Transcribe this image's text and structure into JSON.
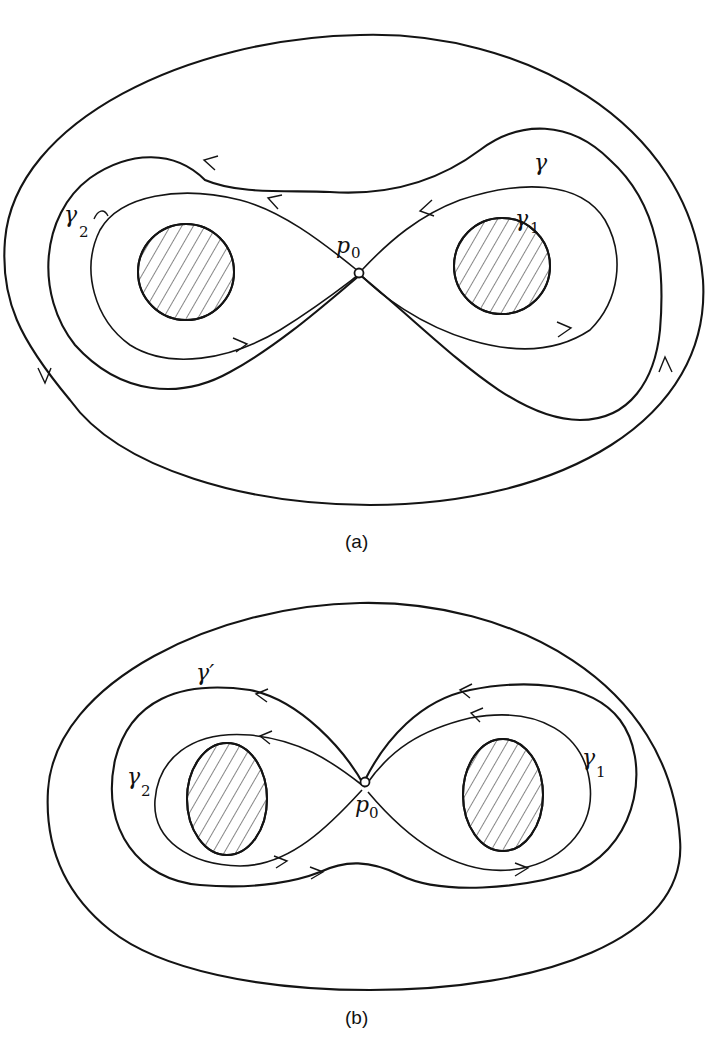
{
  "figure_a": {
    "caption": "(a)",
    "labels": {
      "gamma": "γ",
      "gamma1": "γ",
      "gamma1_sub": "1",
      "gamma2": "γ",
      "gamma2_sub": "2",
      "p0": "p",
      "p0_sub": "0"
    }
  },
  "figure_b": {
    "caption": "(b)",
    "labels": {
      "gamma_prime": "γ′",
      "gamma1": "γ",
      "gamma1_sub": "1",
      "gamma2": "γ",
      "gamma2_sub": "2",
      "p0": "p",
      "p0_sub": "0"
    }
  },
  "colors": {
    "stroke": "#141414",
    "background": "#ffffff"
  }
}
